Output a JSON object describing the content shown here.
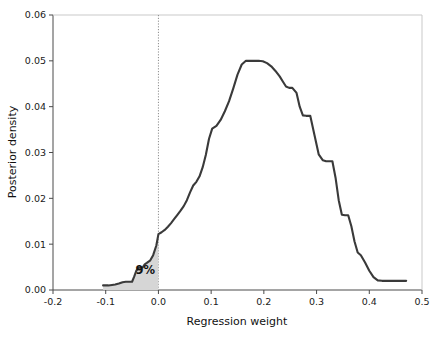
{
  "chart_data": {
    "type": "area",
    "title": "",
    "xlabel": "Regression weight",
    "ylabel": "Posterior density",
    "xlim": [
      -0.2,
      0.5
    ],
    "ylim": [
      0.0,
      0.06
    ],
    "grid": false,
    "legend": null,
    "xticks": [
      -0.2,
      -0.1,
      0.0,
      0.1,
      0.2,
      0.3,
      0.4,
      0.5
    ],
    "xticklabels": [
      "-0.2",
      "-0.1",
      "0.0",
      "0.1",
      "0.2",
      "0.3",
      "0.4",
      "0.5"
    ],
    "yticks": [
      0.0,
      0.01,
      0.02,
      0.03,
      0.04,
      0.05,
      0.06
    ],
    "yticklabels": [
      "0.00",
      "0.01",
      "0.02",
      "0.03",
      "0.04",
      "0.05",
      "0.06"
    ],
    "annotations": [
      {
        "text": "9%",
        "x": -0.025,
        "y": 0.0035,
        "meaning": "shaded-area-probability-below-zero"
      }
    ],
    "reference_lines": [
      {
        "orientation": "vertical",
        "x": 0.0,
        "style": "dotted",
        "color": "#8d8d8d"
      }
    ],
    "shaded_region": {
      "from_x": -0.105,
      "to_x": 0.0,
      "color": "#d6d6d6",
      "label": "9%"
    },
    "series": [
      {
        "name": "posterior density",
        "color": "#3a3a3a",
        "x": [
          -0.105,
          -0.095,
          -0.088,
          -0.082,
          -0.075,
          -0.068,
          -0.062,
          -0.056,
          -0.05,
          -0.046,
          -0.042,
          -0.038,
          -0.034,
          -0.03,
          -0.026,
          -0.022,
          -0.016,
          -0.01,
          -0.004,
          0.0,
          0.006,
          0.012,
          0.018,
          0.024,
          0.03,
          0.036,
          0.042,
          0.048,
          0.054,
          0.06,
          0.066,
          0.072,
          0.078,
          0.084,
          0.09,
          0.096,
          0.102,
          0.11,
          0.118,
          0.126,
          0.134,
          0.142,
          0.15,
          0.158,
          0.166,
          0.174,
          0.182,
          0.19,
          0.198,
          0.206,
          0.214,
          0.222,
          0.23,
          0.236,
          0.242,
          0.248,
          0.254,
          0.262,
          0.268,
          0.274,
          0.28,
          0.288,
          0.296,
          0.304,
          0.312,
          0.318,
          0.324,
          0.33,
          0.336,
          0.342,
          0.348,
          0.354,
          0.36,
          0.366,
          0.372,
          0.378,
          0.384,
          0.392,
          0.4,
          0.408,
          0.416,
          0.424,
          0.44,
          0.455,
          0.47
        ],
        "y": [
          0.001,
          0.001,
          0.0011,
          0.0012,
          0.0014,
          0.0017,
          0.0018,
          0.0018,
          0.0018,
          0.0029,
          0.0042,
          0.0048,
          0.0049,
          0.0049,
          0.0056,
          0.0059,
          0.0064,
          0.0076,
          0.0097,
          0.0122,
          0.0126,
          0.0131,
          0.0138,
          0.0146,
          0.0155,
          0.0164,
          0.0173,
          0.0183,
          0.0196,
          0.0213,
          0.0228,
          0.0236,
          0.0248,
          0.0268,
          0.0295,
          0.033,
          0.0352,
          0.0358,
          0.0371,
          0.039,
          0.0412,
          0.044,
          0.047,
          0.0492,
          0.05,
          0.05,
          0.05,
          0.05,
          0.0499,
          0.0495,
          0.0488,
          0.0478,
          0.0466,
          0.0455,
          0.0444,
          0.0441,
          0.0441,
          0.043,
          0.04,
          0.0381,
          0.038,
          0.038,
          0.0338,
          0.0296,
          0.0283,
          0.0281,
          0.0281,
          0.0281,
          0.0245,
          0.0196,
          0.0164,
          0.0163,
          0.0163,
          0.0139,
          0.0106,
          0.0082,
          0.0076,
          0.006,
          0.0042,
          0.0028,
          0.0021,
          0.002,
          0.002,
          0.002,
          0.002
        ]
      }
    ]
  },
  "axes": {
    "plot_left_px": 53,
    "plot_right_px": 422,
    "plot_top_px": 15,
    "plot_bottom_px": 290
  }
}
